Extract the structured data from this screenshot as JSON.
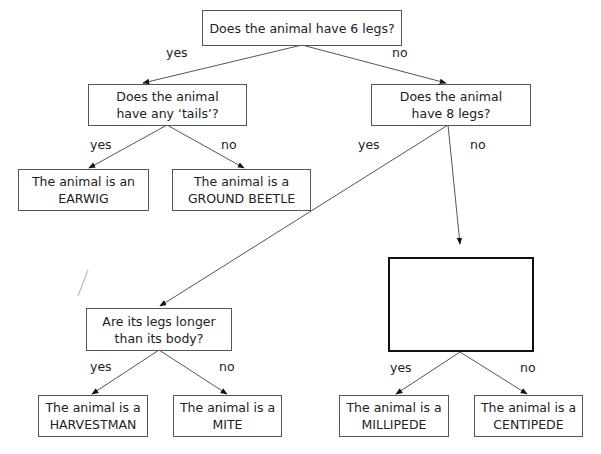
{
  "diagram": {
    "type": "dichotomous-key",
    "nodes": {
      "q_six_legs": {
        "lines": [
          "Does the animal have 6 legs?"
        ]
      },
      "q_tails": {
        "lines": [
          "Does the animal",
          "have any ‘tails’?"
        ]
      },
      "q_eight_legs": {
        "lines": [
          "Does the animal",
          "have 8 legs?"
        ]
      },
      "earwig": {
        "lines": [
          "The animal is an",
          "EARWIG"
        ]
      },
      "ground_beetle": {
        "lines": [
          "The animal is a",
          "GROUND BEETLE"
        ]
      },
      "blank_question": {
        "lines": []
      },
      "q_legs_longer": {
        "lines": [
          "Are its legs longer",
          "than its body?"
        ]
      },
      "harvestman": {
        "lines": [
          "The animal is a",
          "HARVESTMAN"
        ]
      },
      "mite": {
        "lines": [
          "The animal is a",
          "MITE"
        ]
      },
      "millipede": {
        "lines": [
          "The animal is a",
          "MILLIPEDE"
        ]
      },
      "centipede": {
        "lines": [
          "The animal is a",
          "CENTIPEDE"
        ]
      }
    },
    "edge_labels": {
      "six_yes": "yes",
      "six_no": "no",
      "tails_yes": "yes",
      "tails_no": "no",
      "eight_yes": "yes",
      "eight_no": "no",
      "longer_yes": "yes",
      "longer_no": "no",
      "blank_yes": "yes",
      "blank_no": "no"
    },
    "edges": [
      {
        "from": "q_six_legs",
        "to": "q_tails",
        "label": "yes"
      },
      {
        "from": "q_six_legs",
        "to": "q_eight_legs",
        "label": "no"
      },
      {
        "from": "q_tails",
        "to": "earwig",
        "label": "yes"
      },
      {
        "from": "q_tails",
        "to": "ground_beetle",
        "label": "no"
      },
      {
        "from": "q_eight_legs",
        "to": "q_legs_longer",
        "label": "yes"
      },
      {
        "from": "q_eight_legs",
        "to": "blank_question",
        "label": "no"
      },
      {
        "from": "q_legs_longer",
        "to": "harvestman",
        "label": "yes"
      },
      {
        "from": "q_legs_longer",
        "to": "mite",
        "label": "no"
      },
      {
        "from": "blank_question",
        "to": "millipede",
        "label": "yes"
      },
      {
        "from": "blank_question",
        "to": "centipede",
        "label": "no"
      }
    ]
  }
}
